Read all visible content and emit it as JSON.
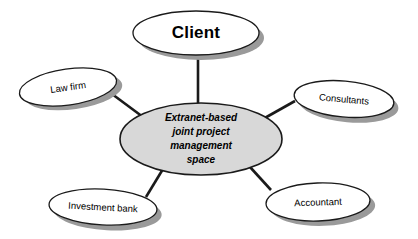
{
  "diagram": {
    "type": "hub-and-spoke",
    "title_text": "",
    "background_color": "#ffffff",
    "center": {
      "id": "extranet-space",
      "lines": [
        "Extranet-based",
        "joint project",
        "management",
        "space"
      ],
      "fill_color": "#d8d8d8",
      "stroke_color": "#1a1a1a",
      "cx": 201,
      "cy": 139,
      "rx": 81,
      "ry": 36
    },
    "nodes": [
      {
        "id": "client",
        "label": "Client",
        "emphasis": "bold-large",
        "fill_color": "#ffffff",
        "shadow_color": "#9a9a9a",
        "cx": 196,
        "cy": 33,
        "rx": 63,
        "ry": 22,
        "rotation": 0
      },
      {
        "id": "law-firm",
        "label": "Law firm",
        "emphasis": "normal",
        "fill_color": "#ffffff",
        "shadow_color": "#9a9a9a",
        "cx": 68,
        "cy": 87,
        "rx": 49,
        "ry": 18,
        "rotation": -8
      },
      {
        "id": "consultants",
        "label": "Consultants",
        "emphasis": "normal",
        "fill_color": "#ffffff",
        "shadow_color": "#9a9a9a",
        "cx": 344,
        "cy": 99,
        "rx": 50,
        "ry": 18,
        "rotation": 5
      },
      {
        "id": "investment-bank",
        "label": "Investment bank",
        "emphasis": "normal",
        "fill_color": "#ffffff",
        "shadow_color": "#9a9a9a",
        "cx": 103,
        "cy": 207,
        "rx": 54,
        "ry": 18,
        "rotation": 3
      },
      {
        "id": "accountant",
        "label": "Accountant",
        "emphasis": "normal",
        "fill_color": "#ffffff",
        "shadow_color": "#9a9a9a",
        "cx": 318,
        "cy": 202,
        "rx": 52,
        "ry": 19,
        "rotation": -2
      }
    ],
    "connectors": [
      {
        "id": "client-to-center",
        "from": "client",
        "to": "extranet-space",
        "x1": 198,
        "y1": 57,
        "x2": 198,
        "y2": 104
      },
      {
        "id": "law-firm-to-center",
        "from": "law-firm",
        "to": "extranet-space",
        "x1": 112,
        "y1": 94,
        "x2": 143,
        "y2": 117
      },
      {
        "id": "consultants-to-center",
        "from": "consultants",
        "to": "extranet-space",
        "x1": 295,
        "y1": 101,
        "x2": 263,
        "y2": 119
      },
      {
        "id": "investment-bank-to-center",
        "from": "investment-bank",
        "to": "extranet-space",
        "x1": 146,
        "y1": 197,
        "x2": 163,
        "y2": 169
      },
      {
        "id": "accountant-to-center",
        "from": "accountant",
        "to": "extranet-space",
        "x1": 271,
        "y1": 190,
        "x2": 250,
        "y2": 167
      }
    ]
  }
}
